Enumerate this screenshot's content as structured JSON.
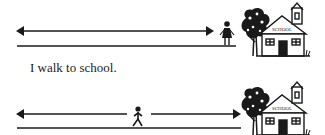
{
  "caption": "I walk to school.",
  "school_sign": "SCHOOL",
  "scenes": [
    {
      "name": "at-school",
      "description": "Child standing next to the school at the end of the path"
    },
    {
      "name": "walking",
      "description": "Child walking along the path toward the school"
    }
  ],
  "colors": {
    "ink": "#1a1a1a",
    "background": "#ffffff"
  }
}
